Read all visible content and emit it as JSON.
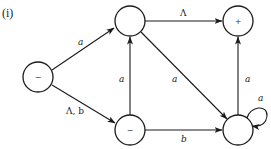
{
  "caption": "(i)",
  "nodes": [
    {
      "id": "q0",
      "label": "−",
      "cx": 38,
      "cy": 77
    },
    {
      "id": "q1",
      "label": "",
      "cx": 130,
      "cy": 21
    },
    {
      "id": "q2",
      "label": "+",
      "cx": 238,
      "cy": 21
    },
    {
      "id": "q3",
      "label": "−",
      "cx": 130,
      "cy": 130
    },
    {
      "id": "q4",
      "label": "",
      "cx": 238,
      "cy": 130
    }
  ],
  "edges": [
    {
      "from": "q0",
      "to": "q1",
      "label": "a"
    },
    {
      "from": "q0",
      "to": "q3",
      "label": "Λ, b"
    },
    {
      "from": "q1",
      "to": "q2",
      "label": "Λ"
    },
    {
      "from": "q3",
      "to": "q1",
      "label": "a"
    },
    {
      "from": "q1",
      "to": "q4",
      "label": "a"
    },
    {
      "from": "q3",
      "to": "q4",
      "label": "b"
    },
    {
      "from": "q4",
      "to": "q2",
      "label": "a"
    },
    {
      "from": "q4",
      "to": "q4",
      "label": "a"
    }
  ]
}
